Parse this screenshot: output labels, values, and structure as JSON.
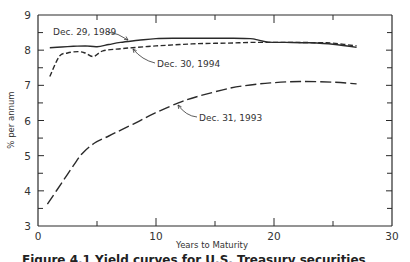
{
  "chart_data": {
    "type": "line",
    "title": "",
    "xlabel": "Years to Maturity",
    "ylabel": "% per annum",
    "xlim": [
      0,
      30
    ],
    "ylim": [
      3,
      9
    ],
    "x_ticks": [
      0,
      10,
      20,
      30
    ],
    "x_minor_ticks": [
      5,
      15,
      25
    ],
    "y_ticks": [
      3,
      4,
      5,
      6,
      7,
      8,
      9
    ],
    "grid": false,
    "legend": "none (inline arrow annotations)",
    "series": [
      {
        "name": "Dec. 29, 1989",
        "style": "solid",
        "x": [
          1,
          2,
          3,
          4,
          5,
          6,
          7,
          8.5,
          10,
          12,
          14,
          16,
          18,
          18.5,
          19.5,
          21,
          23,
          25,
          27
        ],
        "y": [
          8.07,
          8.09,
          8.11,
          8.12,
          8.1,
          8.16,
          8.22,
          8.28,
          8.33,
          8.34,
          8.34,
          8.34,
          8.33,
          8.3,
          8.23,
          8.22,
          8.21,
          8.17,
          8.08
        ]
      },
      {
        "name": "Dec. 30, 1994",
        "style": "short-dash",
        "x": [
          1,
          1.8,
          2.5,
          3.4,
          4.0,
          4.7,
          5.5,
          7,
          8,
          10,
          12,
          14,
          16,
          18,
          20,
          22,
          24,
          25,
          27
        ],
        "y": [
          7.25,
          7.82,
          7.92,
          7.96,
          7.92,
          7.82,
          7.98,
          8.04,
          8.07,
          8.12,
          8.16,
          8.19,
          8.2,
          8.22,
          8.22,
          8.22,
          8.21,
          8.2,
          8.12
        ]
      },
      {
        "name": "Dec. 31, 1993",
        "style": "long-dash",
        "x": [
          0.8,
          2,
          3.25,
          3.8,
          4.8,
          6,
          7.1,
          8.5,
          9.9,
          11.9,
          13.6,
          16.3,
          18,
          19.7,
          22.2,
          25,
          27
        ],
        "y": [
          3.62,
          4.22,
          4.84,
          5.08,
          5.36,
          5.56,
          5.74,
          5.97,
          6.21,
          6.5,
          6.69,
          6.92,
          7.01,
          7.07,
          7.11,
          7.09,
          7.04
        ]
      }
    ],
    "annotations": [
      {
        "text": "Dec. 29, 1989",
        "points_to_series": "Dec. 29, 1989",
        "label_x": 53,
        "label_y": 35,
        "arrow": "M108,32 Q118,33 128,40"
      },
      {
        "text": "Dec. 30, 1994",
        "points_to_series": "Dec. 30, 1994",
        "label_x": 157,
        "label_y": 67,
        "arrow": "M155,63 Q142,60 133,49"
      },
      {
        "text": "Dec. 31, 1993",
        "points_to_series": "Dec. 31, 1993",
        "label_x": 199,
        "label_y": 121,
        "arrow": "M197,117 Q186,116 178,105"
      }
    ]
  },
  "labels": {
    "x_axis_title": "Years to Maturity",
    "y_axis_title": "% per annum",
    "caption_partial": "Figure 4.1   Yield curves for U.S. Treasury securities"
  },
  "colors": {
    "ink": "#2a2a2a",
    "background": "#ffffff"
  }
}
